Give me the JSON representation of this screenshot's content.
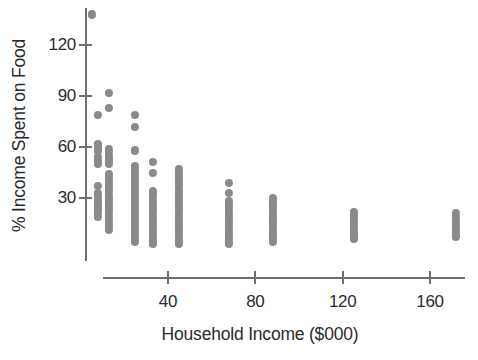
{
  "chart_data": {
    "type": "scatter",
    "title": "",
    "xlabel": "Household Income ($000)",
    "ylabel": "% Income Spent on Food",
    "xlim": [
      0,
      185
    ],
    "ylim": [
      0,
      145
    ],
    "xticks": [
      40,
      80,
      120,
      160
    ],
    "yticks": [
      30,
      60,
      90,
      120
    ],
    "grid": false,
    "legend": null,
    "marker": {
      "shape": "circle",
      "color": "#8a8a8a",
      "size": 8
    },
    "columns": [
      {
        "x": 5,
        "values": [
          138
        ]
      },
      {
        "x": 8,
        "values": [
          79,
          62,
          61,
          60,
          58,
          54,
          52,
          50,
          37,
          33,
          31,
          29,
          27,
          26,
          24,
          23,
          21,
          19
        ]
      },
      {
        "x": 13,
        "values": [
          92,
          83,
          59,
          57,
          55,
          53,
          52,
          51,
          50,
          44,
          42,
          40,
          38,
          36,
          34,
          32,
          30,
          28,
          26,
          25,
          23,
          21,
          19,
          17,
          15,
          13,
          11
        ]
      },
      {
        "x": 25,
        "values": [
          79,
          72,
          58,
          49,
          47,
          45,
          43,
          41,
          39,
          37,
          35,
          33,
          31,
          29,
          27,
          25,
          23,
          21,
          19,
          17,
          15,
          13,
          11,
          9,
          7,
          5,
          4
        ]
      },
      {
        "x": 33,
        "values": [
          51,
          45,
          34,
          33,
          31,
          29,
          27,
          25,
          23,
          21,
          19,
          17,
          15,
          13,
          11,
          9,
          7,
          5,
          4,
          3
        ]
      },
      {
        "x": 45,
        "values": [
          47,
          45,
          43,
          41,
          39,
          37,
          35,
          33,
          31,
          29,
          27,
          25,
          23,
          21,
          19,
          17,
          15,
          13,
          11,
          9,
          7,
          5,
          4,
          3
        ]
      },
      {
        "x": 68,
        "values": [
          39,
          33,
          28,
          26,
          24,
          22,
          20,
          18,
          16,
          14,
          12,
          10,
          8,
          6,
          4,
          3
        ]
      },
      {
        "x": 88,
        "values": [
          30,
          28,
          26,
          24,
          22,
          20,
          18,
          16,
          14,
          12,
          10,
          8,
          6,
          5,
          4
        ]
      },
      {
        "x": 125,
        "values": [
          22,
          20,
          18,
          16,
          14,
          12,
          10,
          8,
          7,
          6
        ]
      },
      {
        "x": 172,
        "values": [
          21,
          19,
          17,
          15,
          13,
          11,
          9,
          8,
          7
        ]
      }
    ]
  }
}
